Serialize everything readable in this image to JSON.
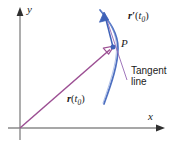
{
  "figure": {
    "background_color": "#ffffff"
  },
  "axes": {
    "x_label": "x",
    "y_label": "y",
    "color": "#8a8a8a",
    "arrow_color": "#3a3a3a",
    "origin": {
      "x": 20,
      "y": 128
    }
  },
  "curve": {
    "name": "parametric-curve",
    "color": "#4d6fc0",
    "stroke_width": 1.6
  },
  "position_vector": {
    "label_bold": "r",
    "label_open": "(",
    "label_var": "t",
    "label_sub": "0",
    "label_close": ")",
    "color": "#9c4f93",
    "from": {
      "x": 20,
      "y": 128
    },
    "to": {
      "x": 113,
      "y": 47
    }
  },
  "tangent_vector": {
    "label_bold": "r",
    "label_prime": "′",
    "label_open": "(",
    "label_var": "t",
    "label_sub": "0",
    "label_close": ")",
    "color": "#3f62b8",
    "from": {
      "x": 113,
      "y": 47
    },
    "to": {
      "x": 104,
      "y": 14
    }
  },
  "tangent_line": {
    "label_line1": "Tangent",
    "label_line2": "line",
    "color": "#9b6fb8"
  },
  "point": {
    "label": "P",
    "dot_color": "#3f62b8",
    "x": 113,
    "y": 47
  }
}
